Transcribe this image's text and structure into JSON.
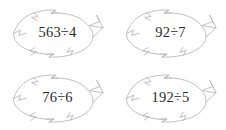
{
  "page": {
    "background_color": "#ffffff",
    "outline_color": "#b9b9b9",
    "text_color": "#2b2b2b"
  },
  "leaves": [
    {
      "id": "leaf-1",
      "position": "top-left",
      "expression": "563÷4",
      "dividend": "563",
      "operator": "÷",
      "divisor": "4",
      "shape": "leaf-icon"
    },
    {
      "id": "leaf-2",
      "position": "top-right",
      "expression": "92÷7",
      "dividend": "92",
      "operator": "÷",
      "divisor": "7",
      "shape": "leaf-icon"
    },
    {
      "id": "leaf-3",
      "position": "bottom-left",
      "expression": "76÷6",
      "dividend": "76",
      "operator": "÷",
      "divisor": "6",
      "shape": "leaf-icon"
    },
    {
      "id": "leaf-4",
      "position": "bottom-right",
      "expression": "192÷5",
      "dividend": "192",
      "operator": "÷",
      "divisor": "5",
      "shape": "leaf-icon"
    }
  ]
}
